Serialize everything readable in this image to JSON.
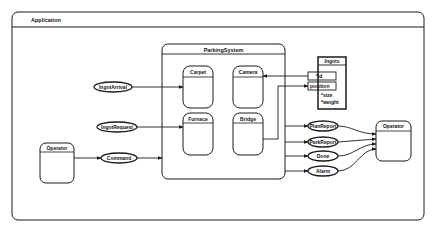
{
  "diagram": {
    "frame": {
      "title": "Application"
    },
    "parking_system": {
      "title": "ParkingSystem",
      "components": [
        {
          "id": "carpet",
          "label": "Carpet"
        },
        {
          "id": "camera",
          "label": "Camera"
        },
        {
          "id": "furnace",
          "label": "Furnace"
        },
        {
          "id": "bridge",
          "label": "Bridge"
        }
      ]
    },
    "ingots": {
      "title": "Ingots",
      "attributes": [
        "*id",
        "position",
        "*size",
        "*weight"
      ]
    },
    "operators": [
      {
        "id": "operator-left",
        "label": "Operator"
      },
      {
        "id": "operator-right",
        "label": "Operator"
      }
    ],
    "messages_in": [
      {
        "id": "ingot-arrival",
        "label": "IngotArrival",
        "target": "Carpet"
      },
      {
        "id": "ingot-request",
        "label": "IngotRequest",
        "target": "Furnace"
      },
      {
        "id": "command",
        "label": "Command",
        "target": "ParkingSystem"
      }
    ],
    "messages_out": [
      {
        "id": "plan-report",
        "label": "PlanReport"
      },
      {
        "id": "park-report",
        "label": "ParkReport"
      },
      {
        "id": "done",
        "label": "Done"
      },
      {
        "id": "alarm",
        "label": "Alarm"
      }
    ],
    "colors": {
      "line": "#1a1a1a",
      "background": "#ffffff"
    }
  }
}
